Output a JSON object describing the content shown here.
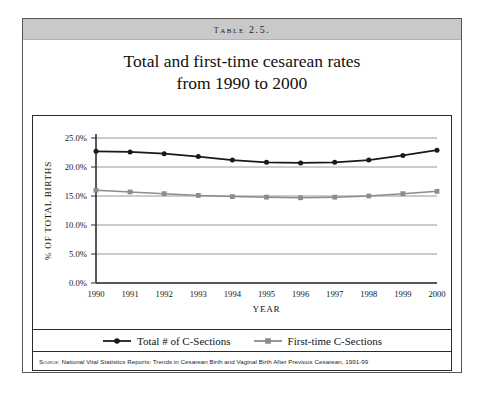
{
  "table": {
    "band_label": "Table 2.5."
  },
  "title": {
    "line1": "Total and first-time cesarean rates",
    "line2": "from 1990 to 2000"
  },
  "source": {
    "label": "Source:",
    "text": "National Vital Statistics Reports: Trends in Cesarean Birth and Vaginal Birth After Previous Cesarean, 1991-99"
  },
  "colors": {
    "total_series": "#1a1a1a",
    "firsttime_series": "#8c8c8c",
    "gridline": "#8d8d8d",
    "axis": "#2f2f2f",
    "band_background": "#c9c9c9",
    "page_border": "#565656"
  },
  "chart_data": {
    "type": "line",
    "title": "Total and first-time cesarean rates from 1990 to 2000",
    "xlabel": "YEAR",
    "ylabel": "% OF TOTAL BIRTHS",
    "categories": [
      "1990",
      "1991",
      "1992",
      "1993",
      "1994",
      "1995",
      "1996",
      "1997",
      "1998",
      "1999",
      "2000"
    ],
    "x_tick_labels": [
      "1990",
      "1991",
      "1992",
      "1993",
      "1994",
      "1995",
      "1996",
      "1997",
      "1998",
      "1999",
      "2000"
    ],
    "y_tick_labels": [
      "0.0%",
      "5.0%",
      "10.0%",
      "15.0%",
      "20.0%",
      "25.0%"
    ],
    "y_tick_values": [
      0,
      5,
      10,
      15,
      20,
      25
    ],
    "ylim": [
      0,
      25
    ],
    "grid": true,
    "legend_position": "bottom",
    "series": [
      {
        "name": "Total # of C-Sections",
        "color": "#1a1a1a",
        "marker": "circle",
        "values": [
          22.7,
          22.6,
          22.3,
          21.8,
          21.2,
          20.8,
          20.7,
          20.8,
          21.2,
          22.0,
          22.9
        ]
      },
      {
        "name": "First-time C-Sections",
        "color": "#8c8c8c",
        "marker": "square",
        "values": [
          16.0,
          15.7,
          15.4,
          15.1,
          14.9,
          14.8,
          14.7,
          14.8,
          15.0,
          15.4,
          15.8
        ]
      }
    ]
  }
}
